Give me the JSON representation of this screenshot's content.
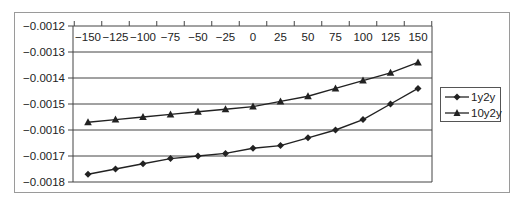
{
  "chart_data": {
    "type": "line",
    "title": "",
    "xlabel": "",
    "ylabel": "",
    "x": [
      -150,
      -125,
      -100,
      -75,
      -50,
      -25,
      0,
      25,
      50,
      75,
      100,
      125,
      150
    ],
    "x_tick_labels": [
      "-150",
      "-125",
      "-100",
      "-75",
      "-50",
      "-25",
      "0",
      "25",
      "50",
      "75",
      "100",
      "125",
      "150"
    ],
    "y_tick_labels": [
      "-0.0012",
      "-0.0013",
      "-0.0014",
      "-0.0015",
      "-0.0016",
      "-0.0017",
      "-0.0018"
    ],
    "y_ticks": [
      -0.0012,
      -0.0013,
      -0.0014,
      -0.0015,
      -0.0016,
      -0.0017,
      -0.0018
    ],
    "ylim": [
      -0.0018,
      -0.0012
    ],
    "xaxis_position": "top",
    "grid": {
      "horizontal": true,
      "vertical": false
    },
    "legend_position": "right",
    "series": [
      {
        "name": "1y2y",
        "marker": "diamond",
        "color": "#222222",
        "values": [
          -0.00177,
          -0.00175,
          -0.00173,
          -0.00171,
          -0.0017,
          -0.00169,
          -0.00167,
          -0.00166,
          -0.00163,
          -0.0016,
          -0.00156,
          -0.0015,
          -0.00144
        ]
      },
      {
        "name": "10y2y",
        "marker": "triangle",
        "color": "#222222",
        "values": [
          -0.00157,
          -0.00156,
          -0.00155,
          -0.00154,
          -0.00153,
          -0.00152,
          -0.00151,
          -0.00149,
          -0.00147,
          -0.00144,
          -0.00141,
          -0.00138,
          -0.00134
        ]
      }
    ]
  },
  "legend": {
    "items": [
      {
        "label": "1y2y"
      },
      {
        "label": "10y2y"
      }
    ]
  }
}
